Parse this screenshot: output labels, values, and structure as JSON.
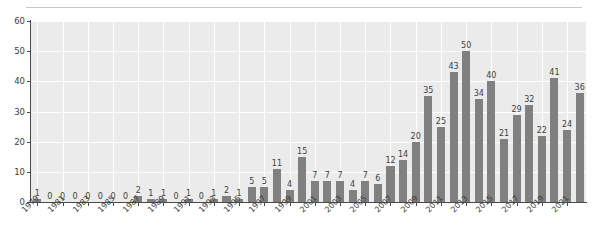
{
  "chart_data": {
    "type": "bar",
    "title": "",
    "subtitle": "",
    "xlabel": "",
    "ylabel": "",
    "ylim": [
      0,
      60
    ],
    "yticks": [
      0,
      10,
      20,
      30,
      40,
      50,
      60
    ],
    "grid": true,
    "legend": null,
    "bar_color": "#808080",
    "plot_background": "#ebebeb",
    "gridline_color": "#ffffff",
    "axis_color": "#4a4a4a",
    "value_labels": true,
    "xtick_labels": [
      "1979",
      "1981",
      "1983",
      "1985",
      "1987",
      "1989",
      "1991",
      "1993",
      "1995",
      "1997",
      "1999",
      "2001",
      "2003",
      "2005",
      "2007",
      "2009",
      "2011",
      "2013",
      "2015",
      "2017",
      "2019",
      "2021"
    ],
    "categories": [
      "1979",
      "1980",
      "1981",
      "1982",
      "1983",
      "1984",
      "1985",
      "1986",
      "1987",
      "1988",
      "1989",
      "1990",
      "1991",
      "1992",
      "1993",
      "1994",
      "1995",
      "1996",
      "1997",
      "1998",
      "1999",
      "2000",
      "2001",
      "2002",
      "2003",
      "2004",
      "2005",
      "2006",
      "2007",
      "2008",
      "2009",
      "2010",
      "2011",
      "2012",
      "2013",
      "2014",
      "2015",
      "2016",
      "2017",
      "2018",
      "2019",
      "2020",
      "2021",
      "2022"
    ],
    "values": [
      1,
      0,
      0,
      0,
      0,
      0,
      0,
      0,
      2,
      1,
      1,
      0,
      1,
      0,
      1,
      2,
      1,
      5,
      5,
      11,
      4,
      15,
      7,
      7,
      7,
      4,
      7,
      6,
      12,
      14,
      20,
      35,
      25,
      43,
      50,
      34,
      40,
      21,
      29,
      32,
      22,
      41,
      24,
      36
    ]
  }
}
